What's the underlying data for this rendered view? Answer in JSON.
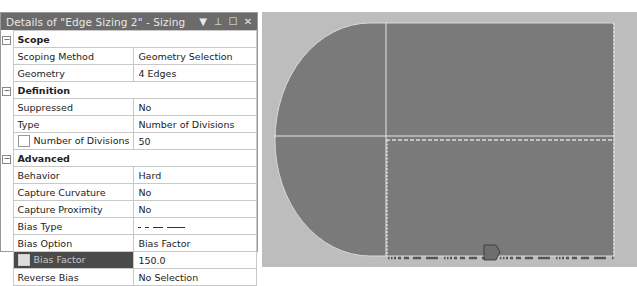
{
  "panel": {
    "title": "Details of \"Edge Sizing 2\" - Sizing",
    "icons": [
      "dropdown-arrow-icon",
      "pin-icon",
      "maximize-icon",
      "close-icon"
    ],
    "icon_glyphs": {
      "dropdown": "▼",
      "pin": "⊥",
      "maximize": "☐",
      "close": "✕"
    },
    "groups": [
      {
        "name": "Scope",
        "expander": "−",
        "rows": [
          {
            "label": "Scoping Method",
            "value": "Geometry Selection"
          },
          {
            "label": "Geometry",
            "value": "4 Edges"
          }
        ]
      },
      {
        "name": "Definition",
        "expander": "−",
        "rows": [
          {
            "label": "Suppressed",
            "value": "No"
          },
          {
            "label": "Type",
            "value": "Number of Divisions"
          },
          {
            "label": "Number of Divisions",
            "value": "50",
            "checkbox": true
          }
        ]
      },
      {
        "name": "Advanced",
        "expander": "−",
        "rows": [
          {
            "label": "Behavior",
            "value": "Hard"
          },
          {
            "label": "Capture Curvature",
            "value": "No"
          },
          {
            "label": "Capture Proximity",
            "value": "No"
          },
          {
            "label": "Bias Type",
            "value": "_ _ __ ___"
          },
          {
            "label": "Bias Option",
            "value": "Bias Factor"
          },
          {
            "label": "Bias Factor",
            "value": "150.0",
            "checkbox": true,
            "selected": true
          },
          {
            "label": "Reverse Bias",
            "value": "No Selection"
          }
        ]
      }
    ]
  },
  "viewport": {
    "background": "#bdbdbd",
    "body_color": "#7a7a7a",
    "edge_color": "#e6e6e6",
    "marker_color": "#666666"
  }
}
